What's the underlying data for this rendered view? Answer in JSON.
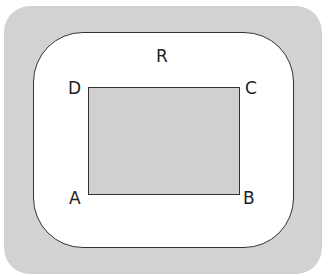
{
  "diagram": {
    "region_label": "R",
    "vertices": {
      "top_left": "D",
      "top_right": "C",
      "bottom_left": "A",
      "bottom_right": "B"
    },
    "colors": {
      "background_frame": "#d2d2d2",
      "region_fill": "#ffffff",
      "rectangle_fill": "#d0d0d0",
      "stroke": "#333333"
    }
  }
}
